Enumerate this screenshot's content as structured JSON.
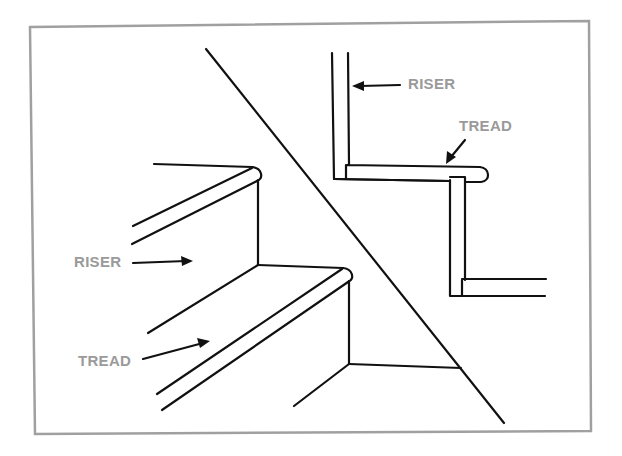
{
  "figure": {
    "frame_color": "#a0a0a0",
    "ink_color": "#111111",
    "label_color": "#9a9a9a"
  },
  "labels": {
    "perspective_riser": "RISER",
    "perspective_tread": "TREAD",
    "section_riser": "RISER",
    "section_tread": "TREAD"
  },
  "panels": [
    {
      "name": "perspective-view",
      "description": "Perspective view of two stair steps"
    },
    {
      "name": "section-view",
      "description": "Cross-section of stair riser and tread with rounded nosing"
    }
  ]
}
